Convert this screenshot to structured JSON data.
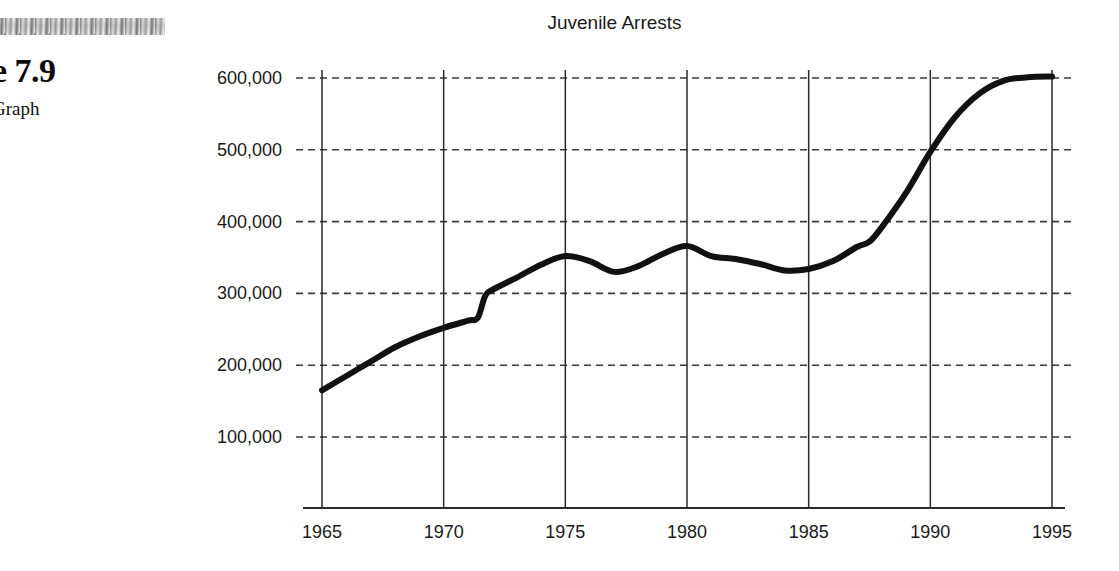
{
  "figure": {
    "number_label": "re 7.9",
    "subtitle_label": "Graph",
    "scan_artifact": "scan-smudge-bar"
  },
  "colors": {
    "line": "#111111",
    "gridline": "#3a3a3a",
    "axis": "#2a2a2a",
    "text": "#1a1a1a",
    "background": "#ffffff"
  },
  "chart_data": {
    "type": "line",
    "title": "Juvenile Arrests",
    "xlabel": "",
    "ylabel": "",
    "xlim": [
      1964,
      1996
    ],
    "ylim": [
      0,
      620000
    ],
    "grid": true,
    "grid_style": "horizontal dashed, vertical solid",
    "legend": "none",
    "x_ticks": [
      1965,
      1970,
      1975,
      1980,
      1985,
      1990,
      1995
    ],
    "x_tick_labels": [
      "1965",
      "1970",
      "1975",
      "1980",
      "1985",
      "1990",
      "1995"
    ],
    "y_ticks": [
      100000,
      200000,
      300000,
      400000,
      500000,
      600000
    ],
    "y_tick_labels": [
      "100,000",
      "200,000",
      "300,000",
      "400,000",
      "500,000",
      "600,000"
    ],
    "series": [
      {
        "name": "Juvenile Arrests",
        "x": [
          1965,
          1966,
          1967,
          1968,
          1969,
          1970,
          1971,
          1971.4,
          1971.7,
          1972,
          1973,
          1974,
          1975,
          1976,
          1977,
          1978,
          1979,
          1980,
          1981,
          1982,
          1983,
          1984,
          1985,
          1986,
          1987,
          1987.5,
          1988,
          1989,
          1990,
          1991,
          1992,
          1993,
          1994,
          1995
        ],
        "y": [
          165000,
          185000,
          205000,
          225000,
          240000,
          252000,
          262000,
          266000,
          296000,
          305000,
          322000,
          340000,
          352000,
          345000,
          330000,
          338000,
          355000,
          366000,
          352000,
          348000,
          341000,
          332000,
          334000,
          345000,
          365000,
          372000,
          392000,
          440000,
          497000,
          545000,
          578000,
          596000,
          601000,
          602000
        ]
      }
    ],
    "annotations": [
      {
        "label": "sharp step increase",
        "x": 1971.5,
        "y": 296000
      },
      {
        "label": "local peak",
        "x": 1975,
        "y": 352000
      },
      {
        "label": "local peak",
        "x": 1980,
        "y": 366000
      },
      {
        "label": "trough",
        "x": 1984,
        "y": 332000
      },
      {
        "label": "steep rise onset",
        "x": 1988,
        "y": 392000
      },
      {
        "label": "plateau",
        "x": 1995,
        "y": 602000
      }
    ]
  }
}
